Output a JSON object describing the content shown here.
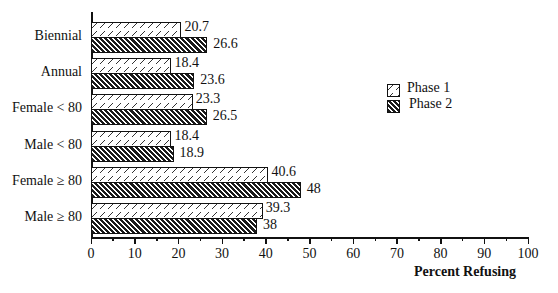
{
  "chart_data": {
    "type": "bar",
    "orientation": "horizontal",
    "title": "",
    "xlabel": "Percent Refusing",
    "ylabel": "",
    "xlim": [
      0,
      100
    ],
    "xticks": [
      "0",
      "10",
      "20",
      "30",
      "40",
      "50",
      "60",
      "70",
      "80",
      "90",
      "100"
    ],
    "categories": [
      "Biennial",
      "Annual",
      "Female < 80",
      "Male <  80",
      "Female ≥ 80",
      "Male ≥ 80"
    ],
    "series": [
      {
        "name": "Phase 1",
        "values": [
          20.7,
          18.4,
          23.3,
          18.4,
          40.6,
          39.3
        ],
        "labels": [
          "20.7",
          "18.4",
          "23.3",
          "18.4",
          "40.6",
          "39.3"
        ]
      },
      {
        "name": "Phase 2",
        "values": [
          26.6,
          23.6,
          26.5,
          18.9,
          48,
          38
        ],
        "labels": [
          "26.6",
          "23.6",
          "26.5",
          "18.9",
          "48",
          "38"
        ]
      }
    ],
    "legend": {
      "position": "right",
      "entries": [
        "Phase 1",
        "Phase 2"
      ]
    },
    "grid": false
  }
}
